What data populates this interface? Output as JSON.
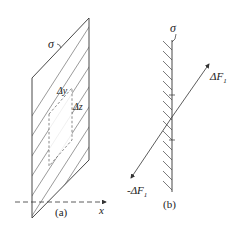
{
  "figure_a": {
    "caption": "(a)",
    "sigma_label": "σ",
    "dy_label": "Δy",
    "dz_label": "Δz",
    "axis_label": "x"
  },
  "figure_b": {
    "caption": "(b)",
    "sigma_label": "σ",
    "force_pos_label": "ΔF",
    "force_pos_sub": "1",
    "force_neg_label": "-ΔF",
    "force_neg_sub": "1"
  },
  "colors": {
    "stroke": "#333333",
    "background": "#ffffff"
  }
}
